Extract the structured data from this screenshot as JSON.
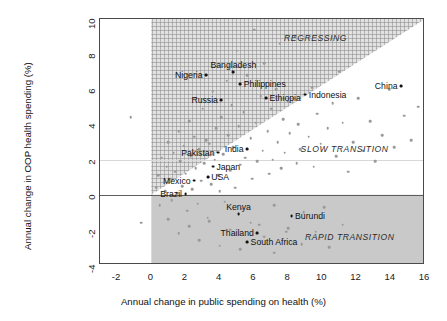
{
  "chart_data": {
    "type": "scatter",
    "title": "",
    "xlabel": "Annual change in public spending on health (%)",
    "ylabel": "Annual change in OOP health spending (%)",
    "xlim": [
      -3,
      16
    ],
    "ylim": [
      -4,
      10
    ],
    "xticks": [
      -2,
      0,
      2,
      4,
      6,
      8,
      10,
      12,
      14,
      16
    ],
    "yticks": [
      -4,
      -2,
      0,
      2,
      4,
      6,
      8,
      10
    ],
    "grid": false,
    "legend": "none",
    "annotations": [
      {
        "text": "REGRESSING",
        "x": 9.6,
        "y": 8.9,
        "style": "italic"
      },
      {
        "text": "SLOW TRANSITION",
        "x": 11.3,
        "y": 2.6,
        "style": "italic"
      },
      {
        "text": "RAPID TRANSITION",
        "x": 11.6,
        "y": -2.4,
        "style": "italic"
      }
    ],
    "zones": [
      {
        "name": "REGRESSING",
        "fill": "#e2e2e2",
        "hatch": "crosshatch",
        "desc": "x>=0, y>=0 and above diagonal y=x*0.625"
      },
      {
        "name": "SLOW TRANSITION",
        "fill": "#ffffff",
        "desc": "x>=0, y>=0 and below diagonal"
      },
      {
        "name": "RAPID TRANSITION",
        "fill": "#c9c9c9",
        "desc": "x>=0, y<0"
      }
    ],
    "reference_lines": [
      {
        "name": "zero-oop-line",
        "type": "horizontal",
        "y": 0
      },
      {
        "name": "parity-diagonal",
        "type": "line",
        "from": [
          0,
          0
        ],
        "to": [
          16,
          10
        ]
      }
    ],
    "labeled_points": [
      {
        "label": "Nigeria",
        "x": 3.2,
        "y": 6.8,
        "label_pos": "left"
      },
      {
        "label": "Bangladesh",
        "x": 4.8,
        "y": 7.0,
        "label_pos": "above"
      },
      {
        "label": "Philippines",
        "x": 5.2,
        "y": 6.3,
        "label_pos": "right"
      },
      {
        "label": "Ethiopia",
        "x": 6.7,
        "y": 5.5,
        "label_pos": "right"
      },
      {
        "label": "Russia",
        "x": 4.1,
        "y": 5.4,
        "label_pos": "left"
      },
      {
        "label": "Indonesia",
        "x": 9.0,
        "y": 5.7,
        "label_pos": "right"
      },
      {
        "label": "China",
        "x": 14.6,
        "y": 6.2,
        "label_pos": "left"
      },
      {
        "label": "India",
        "x": 5.6,
        "y": 2.6,
        "label_pos": "left"
      },
      {
        "label": "Pakistan",
        "x": 3.9,
        "y": 2.4,
        "label_pos": "left"
      },
      {
        "label": "Japan",
        "x": 3.6,
        "y": 1.6,
        "label_pos": "right"
      },
      {
        "label": "USA",
        "x": 3.3,
        "y": 1.0,
        "label_pos": "right"
      },
      {
        "label": "Mexico",
        "x": 2.5,
        "y": 0.8,
        "label_pos": "left"
      },
      {
        "label": "Brazil",
        "x": 2.0,
        "y": 0.05,
        "label_pos": "left"
      },
      {
        "label": "Kenya",
        "x": 5.1,
        "y": -1.1,
        "label_pos": "above"
      },
      {
        "label": "Burundi",
        "x": 8.2,
        "y": -1.2,
        "label_pos": "right"
      },
      {
        "label": "Thailand",
        "x": 6.2,
        "y": -2.2,
        "label_pos": "left"
      },
      {
        "label": "South Africa",
        "x": 5.6,
        "y": -2.7,
        "label_pos": "right"
      }
    ],
    "background_points": [
      [
        -1.2,
        4.4
      ],
      [
        -0.6,
        -1.6
      ],
      [
        0.3,
        0.4
      ],
      [
        0.4,
        1.1
      ],
      [
        0.5,
        -0.6
      ],
      [
        0.6,
        2.1
      ],
      [
        0.8,
        0.2
      ],
      [
        0.9,
        1.6
      ],
      [
        1.0,
        3.0
      ],
      [
        1.1,
        0.9
      ],
      [
        1.2,
        -0.3
      ],
      [
        1.3,
        2.4
      ],
      [
        1.4,
        1.3
      ],
      [
        1.5,
        0.1
      ],
      [
        1.6,
        3.6
      ],
      [
        1.7,
        1.9
      ],
      [
        1.8,
        0.5
      ],
      [
        1.9,
        2.8
      ],
      [
        2.0,
        1.2
      ],
      [
        2.1,
        -0.9
      ],
      [
        2.2,
        4.2
      ],
      [
        2.3,
        2.2
      ],
      [
        2.4,
        0.3
      ],
      [
        2.5,
        3.3
      ],
      [
        2.6,
        1.5
      ],
      [
        2.7,
        -0.5
      ],
      [
        2.8,
        2.6
      ],
      [
        2.9,
        0.8
      ],
      [
        3.0,
        4.9
      ],
      [
        3.1,
        1.8
      ],
      [
        3.2,
        3.1
      ],
      [
        3.3,
        -1.3
      ],
      [
        3.4,
        2.9
      ],
      [
        3.5,
        0.6
      ],
      [
        3.6,
        5.9
      ],
      [
        3.7,
        2.0
      ],
      [
        3.8,
        3.8
      ],
      [
        3.9,
        1.1
      ],
      [
        4.0,
        0.2
      ],
      [
        4.1,
        4.4
      ],
      [
        4.2,
        2.3
      ],
      [
        4.3,
        -0.4
      ],
      [
        4.4,
        6.5
      ],
      [
        4.5,
        3.4
      ],
      [
        4.6,
        1.4
      ],
      [
        4.7,
        5.1
      ],
      [
        4.8,
        2.7
      ],
      [
        4.9,
        0.4
      ],
      [
        5.0,
        8.2
      ],
      [
        5.1,
        3.9
      ],
      [
        5.2,
        1.7
      ],
      [
        5.3,
        -0.8
      ],
      [
        5.4,
        4.7
      ],
      [
        5.5,
        2.1
      ],
      [
        5.6,
        6.8
      ],
      [
        5.8,
        3.2
      ],
      [
        5.9,
        0.9
      ],
      [
        6.0,
        9.4
      ],
      [
        6.1,
        4.1
      ],
      [
        6.2,
        1.9
      ],
      [
        6.3,
        -1.7
      ],
      [
        6.4,
        5.6
      ],
      [
        6.5,
        2.5
      ],
      [
        6.6,
        7.5
      ],
      [
        6.8,
        3.6
      ],
      [
        6.9,
        1.2
      ],
      [
        7.0,
        4.9
      ],
      [
        7.1,
        2.0
      ],
      [
        7.2,
        -0.6
      ],
      [
        7.3,
        6.0
      ],
      [
        7.4,
        3.0
      ],
      [
        7.5,
        8.6
      ],
      [
        7.6,
        1.5
      ],
      [
        7.7,
        4.3
      ],
      [
        7.8,
        2.4
      ],
      [
        7.9,
        -2.1
      ],
      [
        8.0,
        5.3
      ],
      [
        8.1,
        3.5
      ],
      [
        8.4,
        9.0
      ],
      [
        8.5,
        1.8
      ],
      [
        8.6,
        4.0
      ],
      [
        8.7,
        2.6
      ],
      [
        8.9,
        -1.0
      ],
      [
        9.2,
        3.3
      ],
      [
        9.4,
        6.1
      ],
      [
        9.5,
        1.6
      ],
      [
        9.7,
        4.6
      ],
      [
        9.9,
        2.9
      ],
      [
        10.1,
        -0.7
      ],
      [
        10.3,
        3.8
      ],
      [
        10.6,
        5.2
      ],
      [
        10.8,
        2.2
      ],
      [
        11.0,
        7.0
      ],
      [
        11.2,
        4.1
      ],
      [
        11.5,
        1.3
      ],
      [
        11.8,
        3.0
      ],
      [
        12.1,
        5.5
      ],
      [
        12.4,
        2.5
      ],
      [
        12.8,
        4.2
      ],
      [
        13.1,
        1.9
      ],
      [
        13.5,
        3.4
      ],
      [
        13.9,
        6.0
      ],
      [
        14.2,
        2.7
      ],
      [
        14.8,
        4.5
      ],
      [
        15.2,
        3.1
      ],
      [
        15.6,
        5.0
      ],
      [
        1.0,
        -1.4
      ],
      [
        1.6,
        -2.2
      ],
      [
        2.2,
        -1.8
      ],
      [
        2.8,
        -2.6
      ],
      [
        3.4,
        -1.5
      ],
      [
        4.0,
        -2.9
      ],
      [
        4.6,
        -2.0
      ],
      [
        5.2,
        -3.1
      ],
      [
        5.8,
        -1.6
      ],
      [
        6.6,
        -2.4
      ],
      [
        7.2,
        -3.3
      ],
      [
        8.0,
        -1.9
      ],
      [
        8.8,
        -2.8
      ],
      [
        9.6,
        -2.1
      ],
      [
        10.4,
        -3.0
      ],
      [
        11.2,
        -1.7
      ],
      [
        12.0,
        -2.5
      ]
    ]
  }
}
